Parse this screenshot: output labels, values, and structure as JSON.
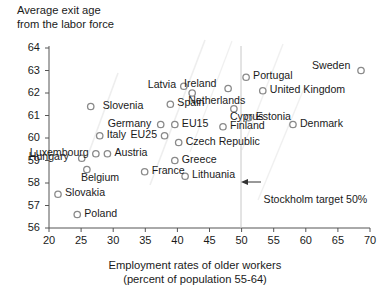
{
  "chart_data": {
    "type": "scatter",
    "title": "",
    "ylabel": "Average exit age\nfrom the labor force",
    "xlabel": "Employment rates of older workers",
    "xlabel_line2": "(percent of population 55-64)",
    "xlim": [
      20,
      70
    ],
    "ylim": [
      56,
      64
    ],
    "xticks": [
      "20",
      "25",
      "30",
      "35",
      "40",
      "45",
      "50",
      "55",
      "60",
      "65",
      "70"
    ],
    "yticks": [
      "56",
      "57",
      "58",
      "59",
      "60",
      "61",
      "62",
      "63",
      "64"
    ],
    "grid": false,
    "legend": "none",
    "marker_style": "open-circle-gray",
    "points": [
      {
        "name": "Slovenia",
        "x": 26.5,
        "y": 61.4,
        "lx": 12,
        "ly": -4
      },
      {
        "name": "Luxembourg",
        "x": 27.3,
        "y": 59.3,
        "lx": -66,
        "ly": -4
      },
      {
        "name": "Hungary",
        "x": 25.1,
        "y": 59.1,
        "lx": -53,
        "ly": -4
      },
      {
        "name": "Belgium",
        "x": 25.9,
        "y": 58.6,
        "lx": -6,
        "ly": 5
      },
      {
        "name": "Slovakia",
        "x": 21.4,
        "y": 57.5,
        "lx": 7,
        "ly": -4
      },
      {
        "name": "Poland",
        "x": 24.4,
        "y": 56.6,
        "lx": 7,
        "ly": -4
      },
      {
        "name": "Italy",
        "x": 27.9,
        "y": 60.1,
        "lx": 7,
        "ly": -4
      },
      {
        "name": "Austria",
        "x": 29.1,
        "y": 59.3,
        "lx": 7,
        "ly": -4
      },
      {
        "name": "Germany",
        "x": 37.4,
        "y": 60.6,
        "lx": -53,
        "ly": -4
      },
      {
        "name": "EU25",
        "x": 38.0,
        "y": 60.1,
        "lx": -34,
        "ly": -4
      },
      {
        "name": "France",
        "x": 34.9,
        "y": 58.5,
        "lx": 7,
        "ly": -4
      },
      {
        "name": "EU15",
        "x": 39.6,
        "y": 60.6,
        "lx": 7,
        "ly": -4
      },
      {
        "name": "Czech Republic",
        "x": 40.2,
        "y": 59.8,
        "lx": 7,
        "ly": -4
      },
      {
        "name": "Greece",
        "x": 39.6,
        "y": 59.0,
        "lx": 7,
        "ly": -4
      },
      {
        "name": "Lithuania",
        "x": 41.2,
        "y": 58.3,
        "lx": 7,
        "ly": -4
      },
      {
        "name": "Spain",
        "x": 38.9,
        "y": 61.5,
        "lx": 7,
        "ly": -4
      },
      {
        "name": "Latvia",
        "x": 41.0,
        "y": 62.3,
        "lx": -36,
        "ly": -4
      },
      {
        "name": "Netherlands",
        "x": 42.3,
        "y": 62.0,
        "lx": -4,
        "ly": 5
      },
      {
        "name": "Ireland",
        "x": 47.9,
        "y": 62.2,
        "lx": -44,
        "ly": -8
      },
      {
        "name": "Finland",
        "x": 47.1,
        "y": 60.5,
        "lx": 7,
        "ly": -4
      },
      {
        "name": "Cyprus",
        "x": 48.8,
        "y": 61.3,
        "lx": -4,
        "ly": 5
      },
      {
        "name": "Estonia",
        "x": 51.1,
        "y": 60.9,
        "lx": 7,
        "ly": -4
      },
      {
        "name": "Portugal",
        "x": 50.7,
        "y": 62.7,
        "lx": 7,
        "ly": -4
      },
      {
        "name": "United Kingdom",
        "x": 53.3,
        "y": 62.1,
        "lx": 7,
        "ly": -4
      },
      {
        "name": "Denmark",
        "x": 58.0,
        "y": 60.6,
        "lx": 7,
        "ly": -4
      },
      {
        "name": "Sweden",
        "x": 68.6,
        "y": 63.0,
        "lx": -49,
        "ly": -8
      }
    ],
    "annotations": [
      {
        "name": "stockholm-target",
        "text": "Stockholm target 50%",
        "x_value": 50,
        "y_value": 57.25
      }
    ],
    "reference_line": {
      "name": "stockholm-target-line",
      "x_value": 50,
      "orientation": "vertical"
    }
  },
  "colors": {
    "axis": "#555555",
    "marker_stroke": "#8a8a8a",
    "marker_fill": "#ffffff",
    "text": "#1a1a1a",
    "reference_line": "#c8c8c8"
  }
}
